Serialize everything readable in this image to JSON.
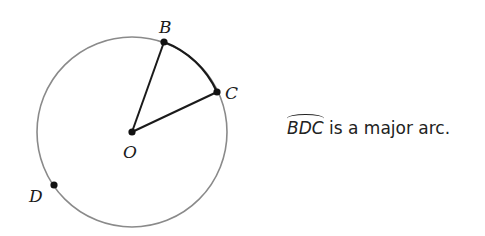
{
  "diagram": {
    "circle": {
      "center_label": "O",
      "stroke": "#808080"
    },
    "points": [
      {
        "label": "B"
      },
      {
        "label": "C"
      },
      {
        "label": "D"
      },
      {
        "label": "O"
      }
    ],
    "highlighted_arc": "BC",
    "radii": [
      "OB",
      "OC"
    ]
  },
  "caption": {
    "arc_name": "BDC",
    "text": " is a major arc."
  }
}
